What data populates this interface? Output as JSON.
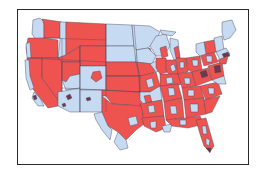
{
  "map": {
    "title": "",
    "region": "Contiguous United States",
    "legend": [],
    "colors": {
      "highlighted": "#ef5350",
      "not_highlighted": "#c6daf2",
      "boundary": "#4a4a5e",
      "frame": "#2a2a2a",
      "background": "#ffffff"
    },
    "categories": [
      {
        "name": "highlighted",
        "color": "#ef5350"
      },
      {
        "name": "not_highlighted",
        "color": "#c6daf2"
      }
    ]
  }
}
